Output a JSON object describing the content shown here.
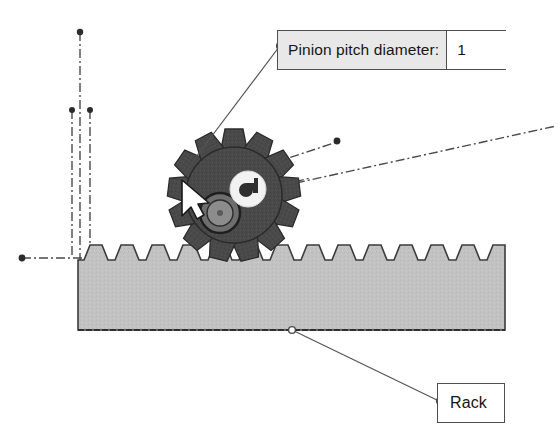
{
  "diagram": {
    "background_color": "#ffffff"
  },
  "callouts": {
    "pinion": {
      "label": "Pinion pitch diameter:",
      "value": "1",
      "box_fill": "#e8e8e8",
      "value_fill": "#ffffff",
      "border_color": "#4f4f4f"
    },
    "rack": {
      "label": "Rack",
      "box_fill": "#ffffff",
      "border_color": "#4f4f4f"
    }
  },
  "parts": {
    "rack": {
      "name": "Rack",
      "fill": "#c2c2c2",
      "edge": "#3c3c3c",
      "tooth_count": 14
    },
    "pinion": {
      "name": "Pinion",
      "fill": "#4a4a4a",
      "edge": "#2b2b2b",
      "tooth_count": 13
    },
    "hub": {
      "name": "Pinion hub",
      "fill": "#8a8a8a"
    },
    "badge": {
      "name": "Gear center badge",
      "fill": "#f2f2f2"
    }
  },
  "construction_lines": {
    "style": "dash-dot",
    "color": "#4a4a4a",
    "count": 6
  },
  "cursor": {
    "name": "mouse-cursor",
    "fill": "#ffffff",
    "edge": "#1a1a1a"
  }
}
